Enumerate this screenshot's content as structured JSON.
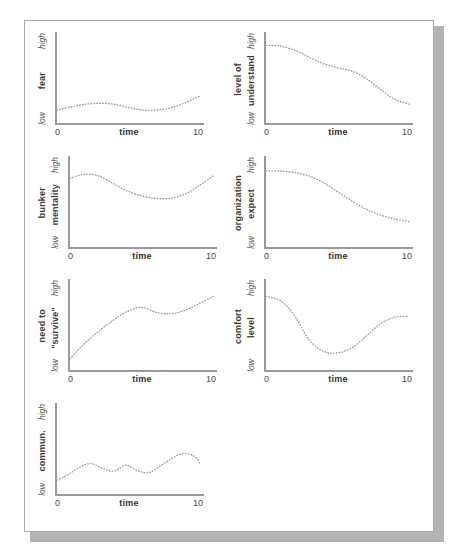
{
  "page": {
    "background_color": "#ffffff",
    "sheet_border_color": "#a8a8a8",
    "shadow_color": "#b4b4b4"
  },
  "axis": {
    "line_color": "#9a9a9a",
    "curve_color": "#9b9b9b",
    "x_min_label": "0",
    "x_max_label": "10",
    "x_title": "time",
    "scale_high": "high",
    "scale_low": "low"
  },
  "chart_data": [
    {
      "type": "line",
      "title": "fear",
      "label_outer": "",
      "label_inner": "fear",
      "xlabel": "time",
      "ylabel": "fear",
      "xlim": [
        0,
        10
      ],
      "ylim": [
        0,
        1
      ],
      "ytick_labels": [
        "low",
        "high"
      ],
      "xtick_labels": [
        "0",
        "10"
      ],
      "grid": false,
      "legend": "none",
      "x": [
        0,
        1,
        2,
        3,
        4,
        5,
        6,
        7,
        8,
        9,
        10
      ],
      "values": [
        0.12,
        0.16,
        0.19,
        0.2,
        0.19,
        0.15,
        0.12,
        0.12,
        0.15,
        0.21,
        0.29
      ]
    },
    {
      "type": "line",
      "title": "level of understand",
      "label_outer": "level of",
      "label_inner": "understand",
      "xlabel": "time",
      "ylabel": "level of understand",
      "xlim": [
        0,
        10
      ],
      "ylim": [
        0,
        1
      ],
      "ytick_labels": [
        "low",
        "high"
      ],
      "xtick_labels": [
        "0",
        "10"
      ],
      "grid": false,
      "legend": "none",
      "x": [
        0,
        1,
        2,
        3,
        4,
        5,
        6,
        7,
        8,
        9,
        10
      ],
      "values": [
        0.9,
        0.89,
        0.84,
        0.76,
        0.68,
        0.63,
        0.59,
        0.5,
        0.37,
        0.25,
        0.19
      ]
    },
    {
      "type": "line",
      "title": "bunker mentality",
      "label_outer": "bunker",
      "label_inner": "mentality",
      "xlabel": "time",
      "ylabel": "bunker mentality",
      "xlim": [
        0,
        10
      ],
      "ylim": [
        0,
        1
      ],
      "ytick_labels": [
        "low",
        "high"
      ],
      "xtick_labels": [
        "0",
        "10"
      ],
      "grid": false,
      "legend": "none",
      "x": [
        0,
        1,
        2,
        3,
        4,
        5,
        6,
        7,
        8,
        9,
        10
      ],
      "values": [
        0.79,
        0.84,
        0.82,
        0.73,
        0.64,
        0.58,
        0.55,
        0.55,
        0.6,
        0.7,
        0.82
      ]
    },
    {
      "type": "line",
      "title": "organization expect",
      "label_outer": "organization",
      "label_inner": "expect",
      "xlabel": "time",
      "ylabel": "organization expect",
      "xlim": [
        0,
        10
      ],
      "ylim": [
        0,
        1
      ],
      "ytick_labels": [
        "low",
        "high"
      ],
      "xtick_labels": [
        "0",
        "10"
      ],
      "grid": false,
      "legend": "none",
      "x": [
        0,
        1,
        2,
        3,
        4,
        5,
        6,
        7,
        8,
        9,
        10
      ],
      "values": [
        0.88,
        0.88,
        0.86,
        0.82,
        0.74,
        0.63,
        0.52,
        0.42,
        0.35,
        0.3,
        0.27
      ]
    },
    {
      "type": "line",
      "title": "need to \"survive\"",
      "label_outer": "need to",
      "label_inner": "\"survive\"",
      "xlabel": "time",
      "ylabel": "need to \"survive\"",
      "xlim": [
        0,
        10
      ],
      "ylim": [
        0,
        1
      ],
      "ytick_labels": [
        "low",
        "high"
      ],
      "xtick_labels": [
        "0",
        "10"
      ],
      "grid": false,
      "legend": "none",
      "x": [
        0,
        1,
        2,
        3,
        4,
        5,
        6,
        7,
        8,
        9,
        10
      ],
      "values": [
        0.1,
        0.28,
        0.43,
        0.56,
        0.67,
        0.72,
        0.66,
        0.64,
        0.68,
        0.76,
        0.85
      ]
    },
    {
      "type": "line",
      "title": "comfort level",
      "label_outer": "comfort",
      "label_inner": "level",
      "xlabel": "time",
      "ylabel": "comfort level",
      "xlim": [
        0,
        10
      ],
      "ylim": [
        0,
        1
      ],
      "ytick_labels": [
        "low",
        "high"
      ],
      "xtick_labels": [
        "0",
        "10"
      ],
      "grid": false,
      "legend": "none",
      "x": [
        0,
        1,
        2,
        3,
        4,
        5,
        6,
        7,
        8,
        9,
        10
      ],
      "values": [
        0.85,
        0.8,
        0.62,
        0.33,
        0.19,
        0.17,
        0.23,
        0.37,
        0.52,
        0.6,
        0.61
      ]
    },
    {
      "type": "line",
      "title": "commun.",
      "label_outer": "",
      "label_inner": "commun.",
      "xlabel": "time",
      "ylabel": "commun.",
      "xlim": [
        0,
        10
      ],
      "ylim": [
        0,
        1
      ],
      "ytick_labels": [
        "low",
        "high"
      ],
      "xtick_labels": [
        "0",
        "10"
      ],
      "grid": false,
      "legend": "none",
      "x": [
        0,
        0.8,
        1.6,
        2.4,
        3.2,
        4,
        4.8,
        5.6,
        6.4,
        7.2,
        8,
        8.8,
        9.6,
        10
      ],
      "values": [
        0.13,
        0.2,
        0.29,
        0.33,
        0.27,
        0.24,
        0.31,
        0.25,
        0.22,
        0.3,
        0.39,
        0.45,
        0.42,
        0.33
      ]
    }
  ]
}
